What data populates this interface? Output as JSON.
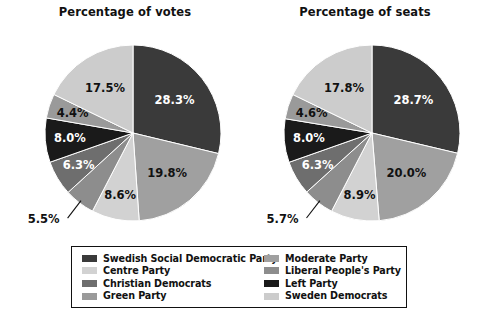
{
  "chart_data": [
    {
      "type": "pie",
      "title": "Percentage of votes",
      "categories": [
        "Swedish Social Democratic Party",
        "Moderate Party",
        "Centre Party",
        "Liberal People's Party",
        "Christian Democrats",
        "Left Party",
        "Green Party",
        "Sweden Democrats"
      ],
      "values": [
        28.3,
        19.8,
        8.6,
        5.5,
        6.3,
        8.0,
        4.4,
        17.5
      ],
      "labels": [
        "28.3%",
        "19.8%",
        "8.6%",
        "5.5%",
        "6.3%",
        "8.0%",
        "4.4%",
        "17.5%"
      ],
      "colors": [
        "#3a3a3a",
        "#a0a0a0",
        "#d2d2d2",
        "#8d8d8d",
        "#6e6e6e",
        "#1a1a1a",
        "#9a9a9a",
        "#cccccc"
      ],
      "label_placement": [
        "inside",
        "inside",
        "inside",
        "outside",
        "inside",
        "inside",
        "inside",
        "inside"
      ],
      "start_angle_deg": 0,
      "direction": "clockwise",
      "legend_position": "bottom"
    },
    {
      "type": "pie",
      "title": "Percentage of seats",
      "categories": [
        "Swedish Social Democratic Party",
        "Moderate Party",
        "Centre Party",
        "Liberal People's Party",
        "Christian Democrats",
        "Left Party",
        "Green Party",
        "Sweden Democrats"
      ],
      "values": [
        28.7,
        20.0,
        8.9,
        5.7,
        6.3,
        8.0,
        4.6,
        17.8
      ],
      "labels": [
        "28.7%",
        "20.0%",
        "8.9%",
        "5.7%",
        "6.3%",
        "8.0%",
        "4.6%",
        "17.8%"
      ],
      "colors": [
        "#3a3a3a",
        "#a0a0a0",
        "#d2d2d2",
        "#8d8d8d",
        "#6e6e6e",
        "#1a1a1a",
        "#9a9a9a",
        "#cccccc"
      ],
      "label_placement": [
        "inside",
        "inside",
        "inside",
        "outside",
        "inside",
        "inside",
        "inside",
        "inside"
      ],
      "start_angle_deg": 0,
      "direction": "clockwise",
      "legend_position": "bottom"
    }
  ],
  "charts": {
    "votes": {
      "title": "Percentage of votes",
      "slices": [
        {
          "label": "28.3%",
          "value": 28.3,
          "party": "Swedish Social Democratic Party",
          "color": "#3a3a3a",
          "text": "light",
          "placement": "inside"
        },
        {
          "label": "19.8%",
          "value": 19.8,
          "party": "Moderate Party",
          "color": "#a0a0a0",
          "text": "dark",
          "placement": "inside"
        },
        {
          "label": "8.6%",
          "value": 8.6,
          "party": "Centre Party",
          "color": "#d2d2d2",
          "text": "dark",
          "placement": "inside"
        },
        {
          "label": "5.5%",
          "value": 5.5,
          "party": "Liberal People's Party",
          "color": "#8d8d8d",
          "text": "dark",
          "placement": "outside"
        },
        {
          "label": "6.3%",
          "value": 6.3,
          "party": "Christian Democrats",
          "color": "#6e6e6e",
          "text": "light",
          "placement": "inside"
        },
        {
          "label": "8.0%",
          "value": 8.0,
          "party": "Left Party",
          "color": "#1a1a1a",
          "text": "light",
          "placement": "inside"
        },
        {
          "label": "4.4%",
          "value": 4.4,
          "party": "Green Party",
          "color": "#9a9a9a",
          "text": "dark",
          "placement": "inside"
        },
        {
          "label": "17.5%",
          "value": 17.5,
          "party": "Sweden Democrats",
          "color": "#cccccc",
          "text": "dark",
          "placement": "inside"
        }
      ]
    },
    "seats": {
      "title": "Percentage of seats",
      "slices": [
        {
          "label": "28.7%",
          "value": 28.7,
          "party": "Swedish Social Democratic Party",
          "color": "#3a3a3a",
          "text": "light",
          "placement": "inside"
        },
        {
          "label": "20.0%",
          "value": 20.0,
          "party": "Moderate Party",
          "color": "#a0a0a0",
          "text": "dark",
          "placement": "inside"
        },
        {
          "label": "8.9%",
          "value": 8.9,
          "party": "Centre Party",
          "color": "#d2d2d2",
          "text": "dark",
          "placement": "inside"
        },
        {
          "label": "5.7%",
          "value": 5.7,
          "party": "Liberal People's Party",
          "color": "#8d8d8d",
          "text": "dark",
          "placement": "outside"
        },
        {
          "label": "6.3%",
          "value": 6.3,
          "party": "Christian Democrats",
          "color": "#6e6e6e",
          "text": "light",
          "placement": "inside"
        },
        {
          "label": "8.0%",
          "value": 8.0,
          "party": "Left Party",
          "color": "#1a1a1a",
          "text": "light",
          "placement": "inside"
        },
        {
          "label": "4.6%",
          "value": 4.6,
          "party": "Green Party",
          "color": "#9a9a9a",
          "text": "dark",
          "placement": "inside"
        },
        {
          "label": "17.8%",
          "value": 17.8,
          "party": "Sweden Democrats",
          "color": "#cccccc",
          "text": "dark",
          "placement": "inside"
        }
      ]
    }
  },
  "legend": {
    "column1": [
      {
        "label": "Swedish Social Democratic Party",
        "color": "#3a3a3a"
      },
      {
        "label": "Centre Party",
        "color": "#d2d2d2"
      },
      {
        "label": "Christian Democrats",
        "color": "#6e6e6e"
      },
      {
        "label": "Green Party",
        "color": "#9a9a9a"
      }
    ],
    "column2": [
      {
        "label": "Moderate Party",
        "color": "#a0a0a0"
      },
      {
        "label": "Liberal People's Party",
        "color": "#8d8d8d"
      },
      {
        "label": "Left Party",
        "color": "#1a1a1a"
      },
      {
        "label": "Sweden Democrats",
        "color": "#cccccc"
      }
    ]
  }
}
